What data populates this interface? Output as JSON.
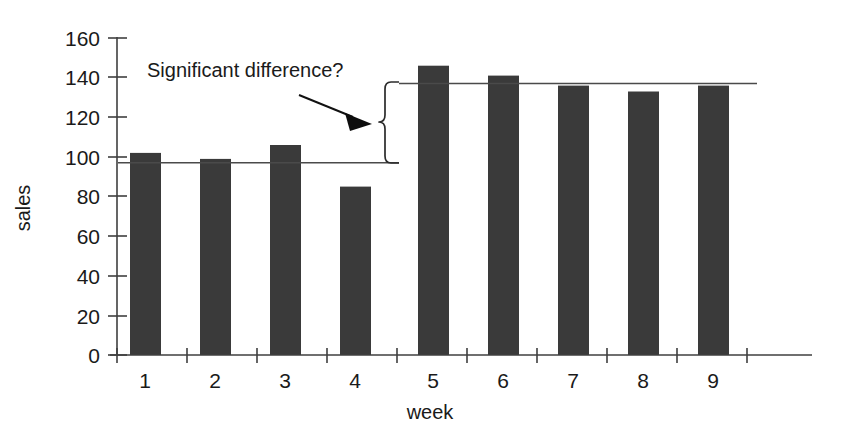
{
  "chart_data": {
    "type": "bar",
    "title": "",
    "subtitle": "",
    "xlabel": "week",
    "ylabel": "sales",
    "categories": [
      "1",
      "2",
      "3",
      "4",
      "5",
      "6",
      "7",
      "8",
      "9"
    ],
    "values": [
      102,
      99,
      106,
      85,
      146,
      141,
      136,
      133,
      136
    ],
    "series": [
      {
        "name": "sales",
        "values": [
          102,
          99,
          106,
          85,
          146,
          141,
          136,
          133,
          136
        ]
      }
    ],
    "ylim": [
      0,
      160
    ],
    "y_ticks": [
      0,
      20,
      40,
      60,
      80,
      100,
      120,
      140,
      160
    ],
    "y_tick_labels": [
      "0",
      "20",
      "40",
      "60",
      "80",
      "100",
      "120",
      "140",
      "160"
    ],
    "x_tick_labels": [
      "1",
      "2",
      "3",
      "4",
      "5",
      "6",
      "7",
      "8",
      "9"
    ],
    "grid": false,
    "legend": false,
    "legend_position": "none",
    "bar_color": "#3a3a3a",
    "axis_color": "#3f3f3f",
    "text_color": "#1a1a1a",
    "annotations": [
      {
        "id": "significant-difference",
        "text": "Significant difference?",
        "kind": "text-with-arrow"
      },
      {
        "id": "lower-reference-line",
        "kind": "reference-line",
        "value": 97,
        "label": "",
        "spans_categories": [
          "1",
          "2",
          "3",
          "4"
        ]
      },
      {
        "id": "upper-reference-line",
        "kind": "reference-line",
        "value": 137,
        "label": "",
        "spans_categories": [
          "5",
          "6",
          "7",
          "8",
          "9"
        ]
      },
      {
        "id": "difference-brace",
        "kind": "brace",
        "from_value": 97,
        "to_value": 137,
        "label": ""
      }
    ]
  },
  "labels": {
    "y_axis_title": "sales",
    "x_axis_title": "week",
    "annotation_text": "Significant difference?"
  }
}
